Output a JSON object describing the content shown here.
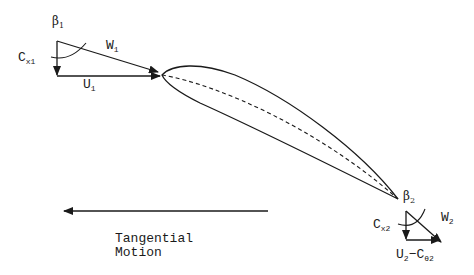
{
  "diagram": {
    "type": "turbine blade velocity triangles",
    "inlet": {
      "angle_label": "β",
      "angle_sub": "1",
      "axial_label": "C",
      "axial_sub": "x1",
      "relative_label": "W",
      "relative_sub": "1",
      "blade_speed_label": "U",
      "blade_speed_sub": "1"
    },
    "outlet": {
      "angle_label": "β",
      "angle_sub": "2",
      "axial_label": "C",
      "axial_sub": "x2",
      "relative_label": "W",
      "relative_sub": "2",
      "blade_speed_label": "U",
      "blade_speed_sub": "2",
      "swirl_label": "−C",
      "swirl_sub": "θ2"
    },
    "motion": {
      "line1": "Tangential",
      "line2": "Motion"
    },
    "colors": {
      "stroke": "#1a1a1a",
      "background": "#ffffff"
    }
  }
}
